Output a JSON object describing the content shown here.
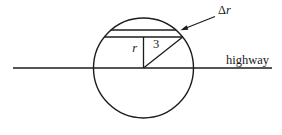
{
  "figure": {
    "type": "geometry-diagram",
    "background_color": "#ffffff",
    "ink_color": "#1c1c1c",
    "labels": {
      "strip_width_symbol": "Δ",
      "strip_width_variable": "r",
      "inner_radius": "r",
      "hypotenuse_value": "3",
      "highway": "highway"
    }
  }
}
